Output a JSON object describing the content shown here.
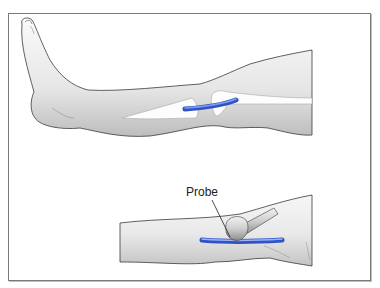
{
  "figure": {
    "panels": [
      {
        "id": "top",
        "description": "Lateral view of lower leg and foot with blue vein segment between two bone/tendon outlines"
      },
      {
        "id": "bottom",
        "description": "Close-up of leg segment with probe applied over blue vein"
      }
    ],
    "labels": {
      "probe": "Probe"
    },
    "colors": {
      "vein": "#3d63d6",
      "vein_highlight": "#7f9bf0",
      "skin_light": "#f4f4f4",
      "skin_shadow": "#b9b9b9",
      "outline": "#444444",
      "frame": "#7a7a7a"
    }
  }
}
